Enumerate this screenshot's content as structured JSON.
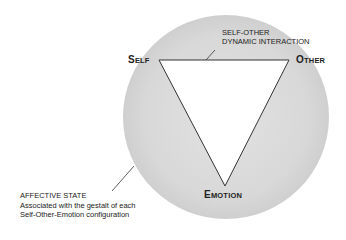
{
  "diagram": {
    "nodes": {
      "self": {
        "initial": "S",
        "rest": "ELF"
      },
      "other": {
        "initial": "O",
        "rest": "THER"
      },
      "emotion": {
        "initial": "E",
        "rest": "MOTION"
      }
    },
    "interaction_label": {
      "line1": "SELF-OTHER",
      "line2": "DYNAMIC INTERACTION"
    },
    "affective_label": {
      "title": "AFFECTIVE STATE",
      "line1": "Associated with the gestalt of each",
      "line2": "Self-Other-Emotion configuration"
    },
    "colors": {
      "circle_fill": "#dcdcdc",
      "triangle_fill": "#ffffff",
      "stroke": "#333333"
    }
  }
}
